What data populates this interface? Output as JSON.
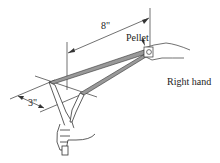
{
  "figure": {
    "labels": {
      "pellet": "Pellet",
      "right_hand": "Right hand",
      "draw_length": "8\"",
      "band_spacing": "3\""
    }
  }
}
